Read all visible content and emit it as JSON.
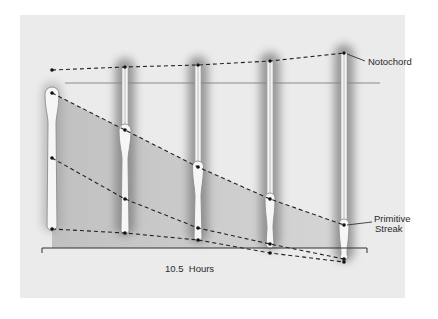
{
  "figure": {
    "background": "#ebebeb",
    "labels": {
      "notochord": "Notochord",
      "primitive_streak_line1": "Primitive",
      "primitive_streak_line2": "Streak",
      "duration": "10.5  Hours"
    },
    "stages": [
      {
        "x": 52,
        "top": 86,
        "bottom": 232,
        "node_width": 14,
        "notochord_top": 70
      },
      {
        "x": 125,
        "top": 62,
        "bottom": 236,
        "node_width": 12,
        "notochord_top": 67
      },
      {
        "x": 198,
        "top": 60,
        "bottom": 243,
        "node_width": 11,
        "notochord_top": 65
      },
      {
        "x": 270,
        "top": 56,
        "bottom": 250,
        "node_width": 10,
        "notochord_top": 61
      },
      {
        "x": 344,
        "top": 48,
        "bottom": 262,
        "node_width": 10,
        "notochord_top": 53
      }
    ],
    "lines": {
      "notochord": [
        [
          52,
          70
        ],
        [
          125,
          67
        ],
        [
          198,
          65
        ],
        [
          270,
          61
        ],
        [
          344,
          53
        ]
      ],
      "streak_top": [
        [
          52,
          93
        ],
        [
          125,
          130
        ],
        [
          198,
          167
        ],
        [
          270,
          199
        ],
        [
          344,
          225
        ]
      ],
      "streak_middle": [
        [
          52,
          158
        ],
        [
          125,
          199
        ],
        [
          198,
          228
        ],
        [
          270,
          244
        ],
        [
          344,
          259
        ]
      ],
      "streak_bottom": [
        [
          52,
          229
        ],
        [
          125,
          233
        ],
        [
          198,
          240
        ],
        [
          270,
          253
        ],
        [
          344,
          262
        ]
      ]
    },
    "reference_line": {
      "y": 83,
      "x1": 65,
      "x2": 380
    },
    "time_bracket": {
      "y": 248,
      "x1": 42,
      "x2": 367
    }
  }
}
